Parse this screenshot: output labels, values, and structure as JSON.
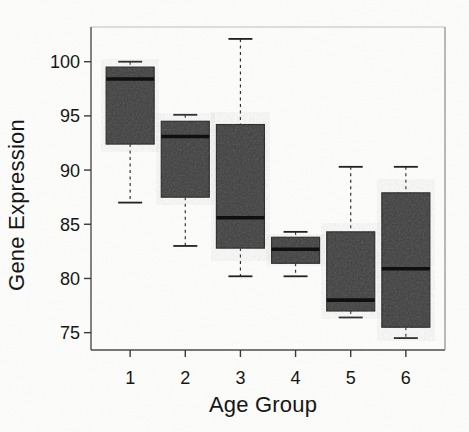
{
  "figure": {
    "background": "#fcfcfb",
    "kind": "scanned-boxplot-figure"
  },
  "chart_data": {
    "type": "boxplot",
    "title": "",
    "xlabel": "Age Group",
    "ylabel": "Gene Expression",
    "categories": [
      "1",
      "2",
      "3",
      "4",
      "5",
      "6"
    ],
    "y_ticks": [
      75,
      80,
      85,
      90,
      95,
      100
    ],
    "ylim": [
      73.4,
      103.2
    ],
    "xlim": [
      0.29,
      6.71
    ],
    "grid": false,
    "legend": "none",
    "series": [
      {
        "group": "1",
        "whisker_low": 87.0,
        "q1": 92.4,
        "median": 98.4,
        "q3": 99.5,
        "whisker_high": 100.0
      },
      {
        "group": "2",
        "whisker_low": 83.0,
        "q1": 87.5,
        "median": 93.1,
        "q3": 94.5,
        "whisker_high": 95.1
      },
      {
        "group": "3",
        "whisker_low": 80.2,
        "q1": 82.8,
        "median": 85.6,
        "q3": 94.2,
        "whisker_high": 102.1
      },
      {
        "group": "4",
        "whisker_low": 80.2,
        "q1": 81.4,
        "median": 82.7,
        "q3": 83.8,
        "whisker_high": 84.3
      },
      {
        "group": "5",
        "whisker_low": 76.4,
        "q1": 77.0,
        "median": 78.0,
        "q3": 84.3,
        "whisker_high": 90.3
      },
      {
        "group": "6",
        "whisker_low": 74.5,
        "q1": 75.5,
        "median": 80.9,
        "q3": 87.9,
        "whisker_high": 90.3
      }
    ],
    "colors": {
      "box_fill": "#3e3e3e",
      "box_stroke": "#222222",
      "median_line": "#0f0f0f",
      "whisker": "#333333",
      "frame_top": "#bdbdbd",
      "frame_left": "#5a5a5a",
      "frame_bottom": "#4d4d4d",
      "frame_right": "#8c8c8c",
      "tick": "#3a3a3a",
      "text": "#161616"
    },
    "whisker_style": "dashed"
  }
}
